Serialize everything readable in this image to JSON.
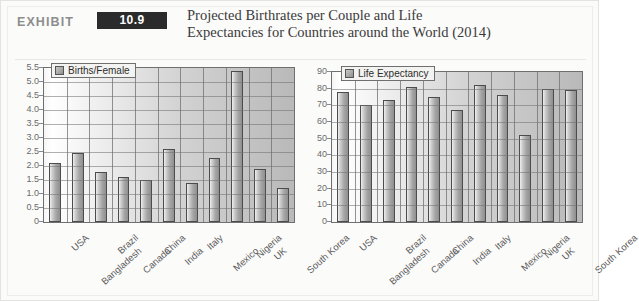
{
  "exhibit": {
    "word": "EXHIBIT",
    "number": "10.9",
    "title_line1": "Projected Birthrates per Couple and Life",
    "title_line2": "Expectancies for Countries around the World (2014)"
  },
  "colors": {
    "badge_bg": "#2b2b2b",
    "badge_text": "#ffffff",
    "exhibit_word": "#8d8d8d",
    "title_text": "#3a3a3a",
    "frame_bg": "#fbfbfa",
    "plot_border": "#6f6f6f",
    "bar_fill": "#a6a6a6",
    "bar_border": "#4c4c4c",
    "axis_text": "#6a6a6a"
  },
  "chart_data": [
    {
      "type": "bar",
      "id": "births-per-female",
      "title": "",
      "xlabel": "",
      "ylabel": "",
      "legend": [
        "Births/Female"
      ],
      "legend_position": "top-left",
      "grid": true,
      "ylim": [
        0,
        5.5
      ],
      "yticks": [
        "5.5",
        "5.0",
        "4.5",
        "4.0",
        "3.5",
        "3.0",
        "2.5",
        "2.0",
        "1.5",
        "1.0",
        "0.5",
        "0"
      ],
      "categories": [
        "USA",
        "Bangladesh",
        "Brazil",
        "Canada",
        "China",
        "India",
        "Italy",
        "Mexico",
        "Nigeria",
        "UK",
        "South Korea"
      ],
      "values": [
        2.1,
        2.45,
        1.8,
        1.6,
        1.5,
        2.6,
        1.4,
        2.3,
        5.4,
        1.9,
        1.2
      ]
    },
    {
      "type": "bar",
      "id": "life-expectancy",
      "title": "",
      "xlabel": "",
      "ylabel": "",
      "legend": [
        "Life Expectancy"
      ],
      "legend_position": "top-left",
      "grid": true,
      "ylim": [
        0,
        90
      ],
      "yticks": [
        "90",
        "80",
        "70",
        "60",
        "50",
        "40",
        "30",
        "20",
        "10",
        "0"
      ],
      "categories": [
        "USA",
        "Bangladesh",
        "Brazil",
        "Canada",
        "China",
        "India",
        "Italy",
        "Mexico",
        "Nigeria",
        "UK",
        "South Korea"
      ],
      "values": [
        78,
        70,
        73,
        81,
        75,
        67,
        82,
        76,
        52,
        80,
        79
      ]
    }
  ]
}
